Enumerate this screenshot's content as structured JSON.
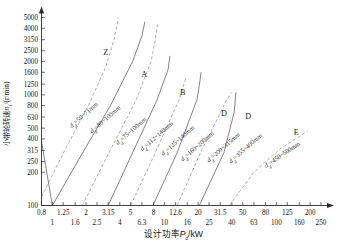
{
  "chart_data": {
    "type": "line",
    "title": "",
    "xlabel": "设计功率Pd/kW",
    "xlabel_main": "设计功率",
    "xlabel_sym": "P",
    "xlabel_sub": "d",
    "xlabel_unit": "/kW",
    "ylabel": "小带轮转速n1/(r/min)",
    "ylabel_main": "小带轮转速",
    "ylabel_sym": "n",
    "ylabel_sub": "1",
    "ylabel_unit": "/(r/min)",
    "xscale": "log",
    "yscale": "log",
    "xlim": [
      0.8,
      250
    ],
    "ylim": [
      100,
      5000
    ],
    "grid": false,
    "legend_position": "inline-curve-labels",
    "x_ticks_upper": [
      0.8,
      1.25,
      2,
      3.15,
      5,
      8,
      12.6,
      20,
      31.5,
      50,
      80,
      125,
      200
    ],
    "x_ticks_lower": [
      1,
      1.6,
      2.5,
      4,
      6.3,
      10,
      16,
      25,
      40,
      63,
      100,
      160,
      250
    ],
    "y_ticks": [
      100,
      200,
      250,
      315,
      400,
      500,
      630,
      800,
      1000,
      1250,
      1600,
      2000,
      2500,
      3150,
      4000,
      5000
    ],
    "series": [
      {
        "name": "Z",
        "letter": "Z",
        "label": "dd=50~71mm",
        "label_sym": "d",
        "label_sub": "d",
        "label_text": "=50~71mm",
        "style": "dashed",
        "points": [
          [
            0.8,
            120
          ],
          [
            1.3,
            320
          ],
          [
            2.1,
            800
          ],
          [
            3.0,
            1800
          ],
          [
            3.55,
            3150
          ],
          [
            3.9,
            5000
          ]
        ]
      },
      {
        "name": "A-lower",
        "letter": "",
        "label": "dd=80~100mm",
        "label_sym": "d",
        "label_sub": "d",
        "label_text": "=80~100mm",
        "style": "solid",
        "points": [
          [
            0.8,
            380
          ],
          [
            1.0,
            100
          ],
          [
            1.9,
            310
          ],
          [
            3.3,
            800
          ],
          [
            5.2,
            2000
          ],
          [
            6.3,
            3400
          ],
          [
            6.7,
            4600
          ]
        ]
      },
      {
        "name": "A",
        "letter": "A",
        "label": "dd=75~100mm",
        "label_sym": "d",
        "label_sub": "d",
        "label_text": "=75~100mm",
        "style": "dashed",
        "points": [
          [
            1.85,
            100
          ],
          [
            3.2,
            300
          ],
          [
            5.6,
            900
          ],
          [
            7.6,
            2000
          ],
          [
            8.3,
            3150
          ],
          [
            8.7,
            4500
          ]
        ]
      },
      {
        "name": "B-lower",
        "letter": "",
        "label": "dd=112~140mm",
        "label_sym": "d",
        "label_sub": "d",
        "label_text": "=112~140mm",
        "style": "solid",
        "points": [
          [
            3.15,
            100
          ],
          [
            5.2,
            300
          ],
          [
            8.6,
            900
          ],
          [
            10.8,
            1700
          ],
          [
            11.2,
            2250
          ]
        ]
      },
      {
        "name": "B",
        "letter": "B",
        "label": "dd=125~140mm",
        "label_sym": "d",
        "label_sub": "d",
        "label_text": "=125~140mm",
        "style": "dashed",
        "points": [
          [
            5.0,
            100
          ],
          [
            8.3,
            300
          ],
          [
            13.5,
            900
          ],
          [
            15.5,
            1400
          ]
        ]
      },
      {
        "name": "C",
        "letter": "C",
        "label": "dd=160~200mm",
        "label_sym": "d",
        "label_sub": "d",
        "label_text": "=160~200mm",
        "style": "solid",
        "points": [
          [
            7.9,
            100
          ],
          [
            13.0,
            300
          ],
          [
            19.5,
            900
          ],
          [
            20.8,
            1350
          ],
          [
            21.2,
            1600
          ]
        ]
      },
      {
        "name": "D",
        "letter": "D",
        "label": "dd=200~315mm",
        "label_sym": "d",
        "label_sub": "d",
        "label_text": "=200~315mm",
        "style": "dashed",
        "points": [
          [
            13.0,
            100
          ],
          [
            21.0,
            300
          ],
          [
            36.0,
            900
          ],
          [
            40.0,
            1050
          ]
        ]
      },
      {
        "name": "D2",
        "letter": "D",
        "label": "dd=355~400mm",
        "label_sym": "d",
        "label_sub": "d",
        "label_text": "=355~400mm",
        "style": "solid",
        "points": [
          [
            20.5,
            100
          ],
          [
            34.0,
            300
          ],
          [
            42.0,
            700
          ],
          [
            43.5,
            1050
          ]
        ]
      },
      {
        "name": "E",
        "letter": "E",
        "label": "dd=450~500mm",
        "label_sym": "d",
        "label_sub": "d",
        "label_text": "=450~500mm",
        "style": "dashed",
        "points": [
          [
            38.0,
            100
          ],
          [
            63.0,
            200
          ],
          [
            110.0,
            330
          ],
          [
            190.0,
            470
          ]
        ]
      }
    ]
  }
}
